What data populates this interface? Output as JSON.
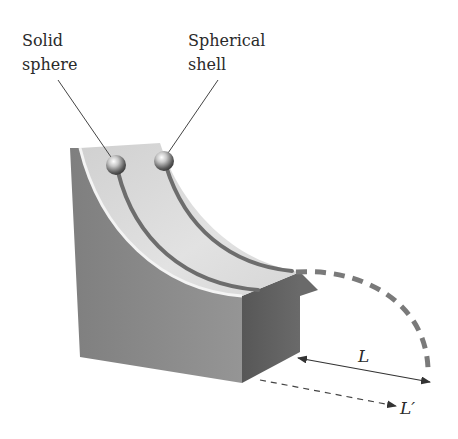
{
  "labels": {
    "solid_sphere_line1": "Solid",
    "solid_sphere_line2": "sphere",
    "spherical_shell_line1": "Spherical",
    "spherical_shell_line2": "shell",
    "distance_L": "L",
    "distance_L_prime": "L′"
  },
  "colors": {
    "background": "#ffffff",
    "block_front": "#8a8a8a",
    "block_right": "#5e5e5e",
    "ramp_surface": "#dcdcdc",
    "groove": "#6d6d6d",
    "trajectory": "#7a7a7a",
    "arrow": "#333333",
    "text": "#2a2a2a"
  },
  "objects": [
    {
      "name": "solid-sphere",
      "type": "sphere",
      "track": "inner"
    },
    {
      "name": "spherical-shell",
      "type": "sphere",
      "track": "outer"
    }
  ]
}
